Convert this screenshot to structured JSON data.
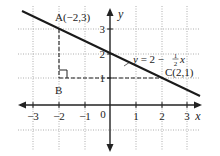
{
  "figure": {
    "type": "coordinate-plane",
    "x_axis_label": "x",
    "y_axis_label": "y",
    "origin_label": "0",
    "x_ticks": [
      {
        "value": -3,
        "label": "−3"
      },
      {
        "value": -2,
        "label": "−2"
      },
      {
        "value": -1,
        "label": "−1"
      },
      {
        "value": 1,
        "label": "1"
      },
      {
        "value": 2,
        "label": "2"
      },
      {
        "value": 3,
        "label": "3"
      }
    ],
    "y_ticks": [
      {
        "value": 1,
        "label": "1"
      },
      {
        "value": 2,
        "label": "2"
      },
      {
        "value": 3,
        "label": "3"
      }
    ],
    "line": {
      "equation_prefix": "y = 2 − ",
      "frac_num": "1",
      "frac_den": "2",
      "equation_suffix": "x",
      "slope": -0.5,
      "intercept": 2
    },
    "points": [
      {
        "name": "A",
        "label": "A(−2,3)",
        "x": -2,
        "y": 3
      },
      {
        "name": "B",
        "label": "B",
        "x": -2,
        "y": 1
      },
      {
        "name": "C",
        "label": "C(2,1)",
        "x": 2,
        "y": 1
      }
    ],
    "colors": {
      "axis": "#222222",
      "grid": "#999999",
      "line": "#1a1a1a",
      "text": "#222222"
    }
  }
}
